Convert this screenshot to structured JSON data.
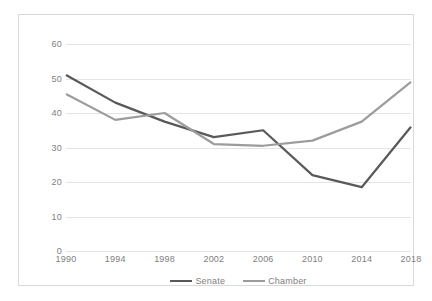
{
  "chart_data": {
    "type": "line",
    "title": "",
    "subtitle": "",
    "xlabel": "",
    "ylabel": "",
    "categories": [
      "1990",
      "1994",
      "1998",
      "2002",
      "2006",
      "2010",
      "2014",
      "2018"
    ],
    "series": [
      {
        "name": "Senate",
        "color": "#595959",
        "values": [
          51,
          43,
          37.5,
          33,
          35,
          22,
          18.5,
          36
        ]
      },
      {
        "name": "Chamber",
        "color": "#9c9c9c",
        "values": [
          45.5,
          38,
          40,
          31,
          30.5,
          32,
          37.5,
          49
        ]
      }
    ],
    "ylim": [
      0,
      60
    ],
    "ytick_labels": [
      "0",
      "10",
      "20",
      "30",
      "40",
      "50",
      "60"
    ],
    "ytick_values": [
      0,
      10,
      20,
      30,
      40,
      50,
      60
    ],
    "grid": true,
    "grid_color": "#e4e4e4",
    "legend_position": "bottom",
    "plot_background": "#ffffff",
    "border_color": "#d9d9d9",
    "tick_label_color": "#808080"
  },
  "legend": {
    "items": [
      {
        "label": "Senate",
        "color": "#595959"
      },
      {
        "label": "Chamber",
        "color": "#9c9c9c"
      }
    ]
  }
}
